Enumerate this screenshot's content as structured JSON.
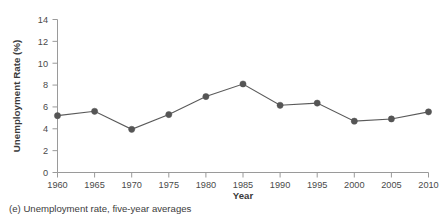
{
  "caption": "(e) Unemployment rate, five-year averages",
  "chart_data": {
    "type": "line",
    "title": "",
    "xlabel": "Year",
    "ylabel": "Unemployment Rate (%)",
    "x": [
      1960,
      1965,
      1970,
      1975,
      1980,
      1985,
      1990,
      1995,
      2000,
      2005,
      2010
    ],
    "values": [
      5.2,
      5.6,
      3.95,
      5.3,
      6.95,
      8.1,
      6.15,
      6.35,
      4.7,
      4.9,
      5.55
    ],
    "xtick_labels": [
      "1960",
      "1965",
      "1970",
      "1975",
      "1980",
      "1985",
      "1990",
      "1995",
      "2000",
      "2005",
      "2010"
    ],
    "ytick_labels": [
      "0",
      "2",
      "4",
      "6",
      "8",
      "10",
      "12",
      "14"
    ],
    "yticks": [
      0,
      2,
      4,
      6,
      8,
      10,
      12,
      14
    ],
    "xlim": [
      1960,
      2010
    ],
    "ylim": [
      0,
      14
    ],
    "grid": false,
    "legend": null,
    "marker": "filled-circle",
    "line_color": "#5a5a5a",
    "marker_color": "#555555",
    "axis_color": "#9a9a9a",
    "background": "#ffffff"
  }
}
